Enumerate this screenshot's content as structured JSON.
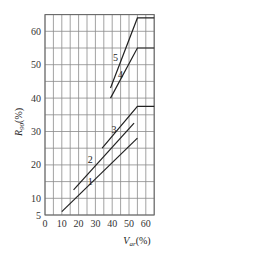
{
  "chart_data": {
    "type": "line",
    "title": "",
    "xlabel": "V_ar(%)",
    "ylabel": "R_90(%)",
    "xlabel_main": "V",
    "xlabel_sub": "ar",
    "xlabel_unit": "(%)",
    "ylabel_main": "R",
    "ylabel_sub": "90",
    "ylabel_unit": "(%)",
    "xlim": [
      0,
      65
    ],
    "ylim": [
      5,
      65
    ],
    "x_ticks": [
      0,
      10,
      20,
      30,
      40,
      50,
      60
    ],
    "y_ticks": [
      5,
      10,
      20,
      30,
      40,
      50,
      60
    ],
    "grid": {
      "on": true,
      "x_step": 5,
      "y_step": 5
    },
    "legend": "none (curves labelled inline 1-5)",
    "series": [
      {
        "name": "1",
        "points": [
          [
            10,
            6
          ],
          [
            55,
            28
          ]
        ],
        "label_pos": [
          27,
          14
        ]
      },
      {
        "name": "2",
        "points": [
          [
            17,
            12.5
          ],
          [
            53,
            32.5
          ]
        ],
        "label_pos": [
          27,
          20.5
        ]
      },
      {
        "name": "3",
        "points": [
          [
            34,
            25
          ],
          [
            55,
            37.5
          ],
          [
            65,
            37.5
          ]
        ],
        "label_pos": [
          41,
          29.5
        ]
      },
      {
        "name": "4",
        "points": [
          [
            39,
            40
          ],
          [
            55,
            55
          ],
          [
            65,
            55
          ]
        ],
        "label_pos": [
          45,
          46
        ]
      },
      {
        "name": "5",
        "points": [
          [
            39,
            43
          ],
          [
            55,
            64
          ],
          [
            65,
            64
          ]
        ],
        "label_pos": [
          42,
          51
        ]
      }
    ]
  }
}
